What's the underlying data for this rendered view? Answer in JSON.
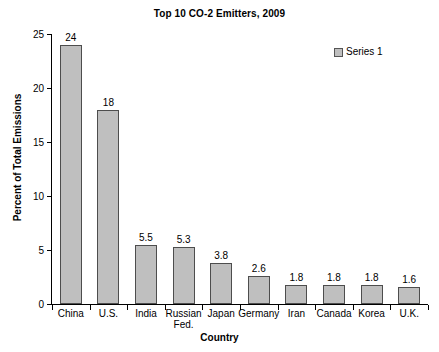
{
  "chart_data": {
    "type": "bar",
    "title": "Top 10 CO-2 Emitters, 2009",
    "xlabel": "Country",
    "ylabel": "Percent of Total Emissions",
    "categories": [
      "China",
      "U.S.",
      "India",
      "Russian Fed.",
      "Japan",
      "Germany",
      "Iran",
      "Canada",
      "Korea",
      "U.K."
    ],
    "category_lines": [
      [
        "China"
      ],
      [
        "U.S."
      ],
      [
        "India"
      ],
      [
        "Russian",
        "Fed."
      ],
      [
        "Japan"
      ],
      [
        "Germany"
      ],
      [
        "Iran"
      ],
      [
        "Canada"
      ],
      [
        "Korea"
      ],
      [
        "U.K."
      ]
    ],
    "values": [
      24,
      18,
      5.5,
      5.3,
      3.8,
      2.6,
      1.8,
      1.8,
      1.8,
      1.6
    ],
    "value_labels": [
      "24",
      "18",
      "5.5",
      "5.3",
      "3.8",
      "2.6",
      "1.8",
      "1.8",
      "1.8",
      "1.6"
    ],
    "series": [
      {
        "name": "Series 1",
        "values": [
          24,
          18,
          5.5,
          5.3,
          3.8,
          2.6,
          1.8,
          1.8,
          1.8,
          1.6
        ]
      }
    ],
    "ylim": [
      0,
      25
    ],
    "yticks": [
      0,
      5,
      10,
      15,
      20,
      25
    ],
    "ytick_labels": [
      "0",
      "5",
      "10",
      "15",
      "20",
      "25"
    ],
    "grid": false,
    "legend_position": "top-right",
    "bar_color": "#bfbfbf",
    "bar_border_color": "#4d4d4d",
    "background_color": "#ffffff",
    "text_color": "#000000"
  },
  "legend": {
    "entries": [
      {
        "label": "Series 1",
        "color": "#bfbfbf"
      }
    ]
  }
}
